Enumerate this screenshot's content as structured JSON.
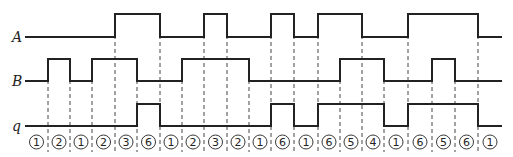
{
  "diagram": {
    "type": "timing-diagram",
    "signals": [
      {
        "name": "A",
        "low_y": 37,
        "high_y": 14,
        "levels": [
          0,
          0,
          0,
          0,
          1,
          1,
          0,
          0,
          1,
          0,
          0,
          1,
          0,
          1,
          1,
          0,
          0,
          1,
          1,
          1,
          0
        ]
      },
      {
        "name": "B",
        "low_y": 81,
        "high_y": 59,
        "levels": [
          0,
          1,
          0,
          1,
          1,
          0,
          0,
          1,
          1,
          1,
          0,
          0,
          0,
          0,
          1,
          1,
          0,
          0,
          1,
          0,
          0
        ]
      },
      {
        "name": "q",
        "low_y": 126,
        "high_y": 104,
        "levels": [
          0,
          0,
          0,
          0,
          0,
          1,
          0,
          0,
          0,
          0,
          0,
          1,
          0,
          1,
          1,
          1,
          0,
          1,
          1,
          1,
          0
        ]
      }
    ],
    "boundaries": [
      25,
      48,
      70,
      92,
      115,
      137,
      160,
      182,
      204,
      227,
      249,
      271,
      294,
      318,
      340,
      362,
      384,
      408,
      432,
      455,
      478,
      502
    ],
    "states": [
      "1",
      "2",
      "1",
      "2",
      "3",
      "6",
      "1",
      "2",
      "3",
      "2",
      "1",
      "6",
      "1",
      "6",
      "5",
      "4",
      "1",
      "6",
      "5",
      "6",
      "1"
    ],
    "states_glyph": [
      "①",
      "②",
      "①",
      "②",
      "③",
      "⑥",
      "①",
      "②",
      "③",
      "②",
      "①",
      "⑥",
      "①",
      "⑥",
      "⑤",
      "④",
      "①",
      "⑥",
      "⑤",
      "⑥",
      "①"
    ]
  }
}
